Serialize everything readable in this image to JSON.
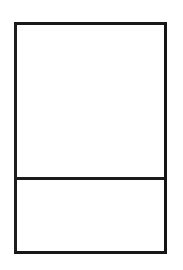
{
  "canvas": {
    "width": 183,
    "height": 270,
    "background_color": "#ffffff"
  },
  "diagram": {
    "type": "wireframe-rectangle",
    "stroke_color": "#1a1a1a",
    "fill_color": "#ffffff",
    "stroke_width_px": 3,
    "frame": {
      "left": 14,
      "top": 22,
      "width": 153,
      "height": 232
    },
    "divider": {
      "orientation": "horizontal",
      "y": 177,
      "thickness_px": 3,
      "color": "#1b1b1b"
    },
    "panels": [
      {
        "id": "upper",
        "label": "",
        "text": "",
        "height_px": 152
      },
      {
        "id": "lower",
        "label": "",
        "text": "",
        "height_px": 74
      }
    ]
  }
}
